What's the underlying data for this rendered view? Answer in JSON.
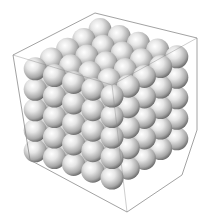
{
  "image": {
    "subject": "3D rendering of a cubic crystal lattice of grey spheres inside a wireframe bounding box",
    "background": "#ffffff",
    "sphere_color": "#d8d8d8",
    "sphere_highlight": "#ffffff",
    "sphere_shadow": "#6a6a6a",
    "box_line_color": "#8a8a8a"
  },
  "lattice": {
    "nx": 5,
    "ny": 5,
    "nz": 5,
    "sphere_radius": 11.5
  },
  "box": {
    "outline": [
      [
        13,
        55
      ],
      [
        95,
        13
      ],
      [
        197,
        38
      ],
      [
        197,
        130
      ],
      [
        182,
        175
      ],
      [
        127,
        212
      ],
      [
        30,
        160
      ]
    ],
    "inner_edges": [
      [
        [
          13,
          55
        ],
        [
          112,
          85
        ]
      ],
      [
        [
          112,
          85
        ],
        [
          197,
          38
        ]
      ],
      [
        [
          112,
          85
        ],
        [
          127,
          212
        ]
      ]
    ]
  }
}
